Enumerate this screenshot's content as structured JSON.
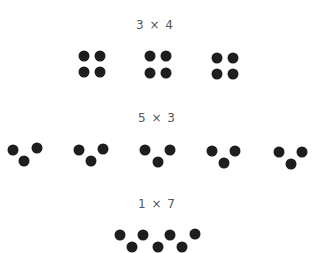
{
  "diagram": {
    "rows": [
      {
        "label": "3 × 4",
        "label_pos": [
          155,
          25
        ],
        "groups": [
          {
            "dots": [
              [
                84,
                56
              ],
              [
                100,
                56
              ],
              [
                84,
                72
              ],
              [
                100,
                72
              ]
            ]
          },
          {
            "dots": [
              [
                150,
                56
              ],
              [
                166,
                56
              ],
              [
                150,
                73
              ],
              [
                166,
                73
              ]
            ]
          },
          {
            "dots": [
              [
                217,
                58
              ],
              [
                233,
                58
              ],
              [
                217,
                74
              ],
              [
                233,
                74
              ]
            ]
          }
        ]
      },
      {
        "label": "5 × 3",
        "label_pos": [
          157,
          118
        ],
        "groups": [
          {
            "dots": [
              [
                13,
                150
              ],
              [
                37,
                148
              ],
              [
                24,
                161
              ]
            ]
          },
          {
            "dots": [
              [
                79,
                150
              ],
              [
                103,
                149
              ],
              [
                91,
                161
              ]
            ]
          },
          {
            "dots": [
              [
                145,
                150
              ],
              [
                170,
                150
              ],
              [
                158,
                162
              ]
            ]
          },
          {
            "dots": [
              [
                212,
                151
              ],
              [
                235,
                151
              ],
              [
                224,
                163
              ]
            ]
          },
          {
            "dots": [
              [
                279,
                152
              ],
              [
                302,
                152
              ],
              [
                291,
                164
              ]
            ]
          }
        ]
      },
      {
        "label": "1 × 7",
        "label_pos": [
          157,
          204
        ],
        "groups": [
          {
            "dots": [
              [
                120,
                235
              ],
              [
                143,
                235
              ],
              [
                170,
                235
              ],
              [
                195,
                234
              ],
              [
                132,
                247
              ],
              [
                158,
                247
              ],
              [
                182,
                247
              ]
            ]
          }
        ]
      }
    ],
    "dot_color": "#1e1e1e"
  }
}
